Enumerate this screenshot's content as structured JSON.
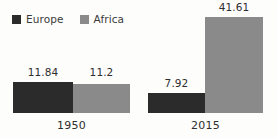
{
  "chart_data": {
    "type": "bar",
    "title": "",
    "subtitle": "",
    "xlabel": "",
    "ylabel": "",
    "categories": [
      "1950",
      "2015"
    ],
    "series": [
      {
        "name": "Europe",
        "color": "#2b2b2b",
        "values": [
          11.84,
          7.92
        ],
        "value_labels": [
          "11.84",
          "7.92"
        ]
      },
      {
        "name": "Africa",
        "color": "#8a8a8a",
        "values": [
          11.2,
          41.61
        ],
        "value_labels": [
          "11.2",
          "41.61"
        ]
      }
    ],
    "ylim": [
      0,
      41.61
    ],
    "grid": false,
    "legend_position": "top-left",
    "data_labels_shown": true,
    "axis_lines_shown": false
  },
  "legend": {
    "items": [
      {
        "label": "Europe",
        "swatch_color": "#2b2b2b",
        "swatch_icon": "square-swatch-icon"
      },
      {
        "label": "Africa",
        "swatch_color": "#8a8a8a",
        "swatch_icon": "square-swatch-icon"
      }
    ]
  },
  "bars": [
    {
      "id": "bar-1950-europe",
      "series": "Europe",
      "category": "1950",
      "label": "11.84",
      "color": "#2b2b2b",
      "left": 13,
      "width": 60,
      "top": 82,
      "height": 31,
      "label_left": 13,
      "label_width": 60,
      "label_top": 67
    },
    {
      "id": "bar-1950-africa",
      "series": "Africa",
      "category": "1950",
      "label": "11.2",
      "color": "#8a8a8a",
      "left": 73,
      "width": 57,
      "top": 84,
      "height": 29,
      "label_left": 73,
      "label_width": 57,
      "label_top": 67
    },
    {
      "id": "bar-2015-europe",
      "series": "Europe",
      "category": "2015",
      "label": "7.92",
      "color": "#2b2b2b",
      "left": 148,
      "width": 57,
      "top": 93,
      "height": 20,
      "label_left": 148,
      "label_width": 57,
      "label_top": 78
    },
    {
      "id": "bar-2015-africa",
      "series": "Africa",
      "category": "2015",
      "label": "41.61",
      "color": "#8a8a8a",
      "left": 205,
      "width": 58,
      "top": 17,
      "height": 96,
      "label_left": 205,
      "label_width": 58,
      "label_top": 2
    }
  ],
  "category_labels": [
    {
      "id": "cat-label-1950",
      "text": "1950",
      "left": 13,
      "width": 117,
      "top": 120
    },
    {
      "id": "cat-label-2015",
      "text": "2015",
      "left": 148,
      "width": 115,
      "top": 120
    }
  ]
}
